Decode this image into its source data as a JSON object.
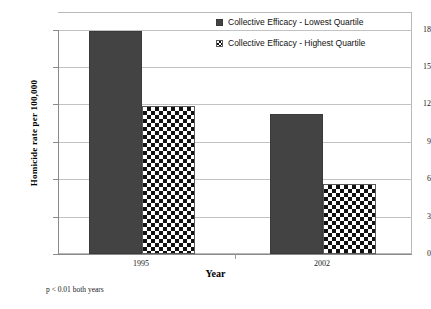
{
  "chart_data": {
    "type": "bar",
    "title": "",
    "xlabel": "Year",
    "ylabel": "Homicide rate per 100,000",
    "categories": [
      "1995",
      "2002"
    ],
    "series": [
      {
        "name": "Collective Efficacy - Lowest Quartile",
        "values": [
          16.6,
          10.4
        ],
        "fill": "solid",
        "color": "#434343"
      },
      {
        "name": "Collective Efficacy - Highest Quartile",
        "values": [
          11.0,
          5.2
        ],
        "fill": "checkered",
        "color": "#111111"
      }
    ],
    "ylim": [
      0,
      18
    ],
    "yticks": [
      "0",
      "3",
      "6",
      "9",
      "12",
      "15",
      "18"
    ],
    "grid": true,
    "legend_position": "top-right",
    "annotation": "p < 0.01 both years"
  },
  "axes": {
    "y_title": "Homicide rate per 100,000",
    "x_title": "Year",
    "y_tick_18": "18",
    "y_tick_15": "15",
    "y_tick_12": "12",
    "y_tick_9": "9",
    "y_tick_6": "6",
    "y_tick_3": "3",
    "y_tick_0": "0",
    "x_tick_1": "1995",
    "x_tick_2": "2002"
  },
  "legend": {
    "item_1": "Collective Efficacy - Lowest Quartile",
    "item_2": "Collective Efficacy - Highest Quartile"
  },
  "footnote": {
    "text": "p < 0.01 both years"
  }
}
